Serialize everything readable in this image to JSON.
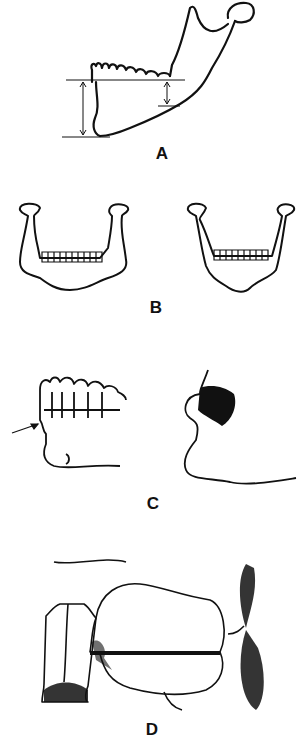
{
  "figure": {
    "panels": [
      {
        "id": "A",
        "label": "A",
        "description": "Lateral view of mandible with height measurement lines"
      },
      {
        "id": "B",
        "label": "B",
        "description": "Frontal views of two mandibles"
      },
      {
        "id": "C",
        "label": "C",
        "description": "Lateral view of dentition with arrow and facial profile"
      },
      {
        "id": "D",
        "label": "D",
        "description": "Cross-sectional drawing with horizontal line"
      }
    ],
    "colors": {
      "line": "#111111",
      "background": "#ffffff"
    }
  }
}
